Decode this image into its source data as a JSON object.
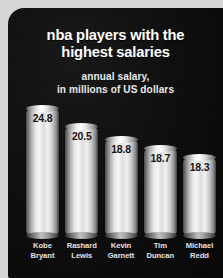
{
  "title": {
    "line1": "nba players with the",
    "line2": "highest salaries"
  },
  "subtitle": {
    "line1": "annual salary,",
    "line2": "in millions of US dollars"
  },
  "colors": {
    "panel_background": "#0d0d0d",
    "frame": "#d6d6d6",
    "title_text": "#ffffff",
    "subtitle_text": "#e9e9e9",
    "bar_light": "#f6f6f6",
    "bar_dark": "#3f3f3f",
    "value_text": "#141414",
    "label_text": "#e4e4e4"
  },
  "chart_data": {
    "type": "bar",
    "title": "nba players with the highest salaries",
    "subtitle": "annual salary, in millions of US dollars",
    "xlabel": "",
    "ylabel": "annual salary, in millions of US dollars",
    "ylim": [
      0,
      24.8
    ],
    "grid": false,
    "legend": "none",
    "categories": [
      "Kobe Bryant",
      "Rashard Lewis",
      "Kevin Garnett",
      "Tim Duncan",
      "Michael Redd"
    ],
    "values": [
      24.8,
      20.5,
      18.8,
      18.7,
      18.3
    ],
    "bars": [
      {
        "name_line1": "Kobe",
        "name_line2": "Bryant",
        "value": 24.8,
        "value_label": "24.8",
        "height_pct": 100
      },
      {
        "name_line1": "Rashard",
        "name_line2": "Lewis",
        "value": 20.5,
        "value_label": "20.5",
        "height_pct": 86
      },
      {
        "name_line1": "Kevin",
        "name_line2": "Garnett",
        "value": 18.8,
        "value_label": "18.8",
        "height_pct": 76
      },
      {
        "name_line1": "Tim",
        "name_line2": "Duncan",
        "value": 18.7,
        "value_label": "18.7",
        "height_pct": 69
      },
      {
        "name_line1": "Michael",
        "name_line2": "Redd",
        "value": 18.3,
        "value_label": "18.3",
        "height_pct": 62
      }
    ]
  }
}
